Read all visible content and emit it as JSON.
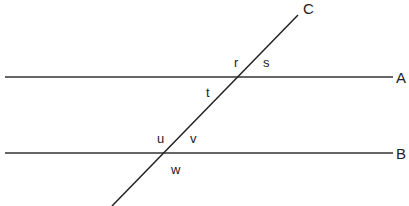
{
  "diagram": {
    "lines": [
      {
        "id": "A",
        "label": "A",
        "x1": 5,
        "y1": 77,
        "x2": 393,
        "y2": 77
      },
      {
        "id": "B",
        "label": "B",
        "x1": 5,
        "y1": 153,
        "x2": 393,
        "y2": 153
      },
      {
        "id": "C",
        "label": "C",
        "x1": 112,
        "y1": 206,
        "x2": 298,
        "y2": 15
      }
    ],
    "angle_labels": {
      "r": "r",
      "s": "s",
      "t": "t",
      "u": "u",
      "v": "v",
      "w": "w"
    },
    "line_labels": {
      "A": "A",
      "B": "B",
      "C": "C"
    },
    "colors": {
      "line": "#222222",
      "background": "#ffffff"
    }
  }
}
